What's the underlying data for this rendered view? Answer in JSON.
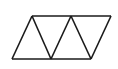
{
  "diagram": {
    "stroke_color": "#1a1a1a",
    "background": "#ffffff",
    "top_vertices": [
      [
        32,
        16
      ],
      [
        71,
        16
      ],
      [
        111,
        16
      ]
    ],
    "bottom_vertices": [
      [
        12,
        59
      ],
      [
        51,
        59
      ],
      [
        91,
        59
      ]
    ],
    "triangle_count": 4
  }
}
